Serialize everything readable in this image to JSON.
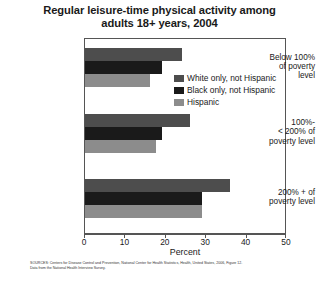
{
  "title": {
    "line1": "Regular leisure-time physical activity among",
    "line2": "adults 18+ years, 2004"
  },
  "axis": {
    "x_title": "Percent",
    "x_ticks": [
      "0",
      "10",
      "20",
      "30",
      "40",
      "50"
    ]
  },
  "legend": {
    "items": [
      {
        "label": "White only, not Hispanic",
        "color": "#4d4d4d"
      },
      {
        "label": "Black only, not Hispanic",
        "color": "#1a1a1a"
      },
      {
        "label": "Hispanic",
        "color": "#8c8c8c"
      }
    ]
  },
  "categories": [
    {
      "line1": "Below 100%",
      "line2": "of poverty",
      "line3": "level"
    },
    {
      "line1": "100%-",
      "line2": "< 200% of",
      "line3": "poverty level"
    },
    {
      "line1": "200% + of",
      "line2": "poverty level",
      "line3": ""
    }
  ],
  "footnote": {
    "line1": "SOURCES: Centers for Disease Control and Prevention, National Center for Health Statistics, Health, United States, 2006, Figure 12.",
    "line2": "Data from the National Health Interview Survey."
  },
  "chart_data": {
    "type": "bar",
    "orientation": "horizontal",
    "title": "Regular leisure-time physical activity among adults 18+ years, 2004",
    "xlabel": "Percent",
    "ylabel": "",
    "xlim": [
      0,
      50
    ],
    "xticks": [
      0,
      10,
      20,
      30,
      40,
      50
    ],
    "grid": false,
    "legend_position": "inside-top-right",
    "categories": [
      "Below 100% of poverty level",
      "100%- < 200% of poverty level",
      "200% + of poverty level"
    ],
    "series": [
      {
        "name": "White only, not Hispanic",
        "color": "#4d4d4d",
        "values": [
          24,
          26,
          36
        ]
      },
      {
        "name": "Black only, not Hispanic",
        "color": "#1a1a1a",
        "values": [
          19,
          19,
          29
        ]
      },
      {
        "name": "Hispanic",
        "color": "#8c8c8c",
        "values": [
          16,
          17.5,
          29
        ]
      }
    ]
  }
}
